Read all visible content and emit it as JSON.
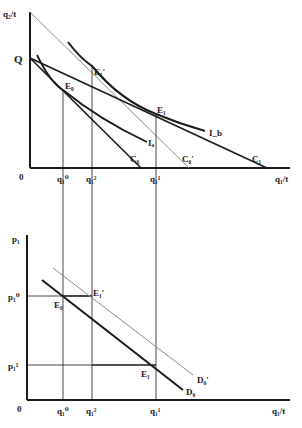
{
  "upper_panel": {
    "y_axis_label": "q₂/t",
    "x_axis_label": "q₁/t",
    "origin_label": "0",
    "endowment_label": "Q",
    "points": {
      "E0": "E₀",
      "E1": "E₁",
      "E1_prime": "E₁′"
    },
    "curves": {
      "Ia": "Iₐ",
      "Ib": "I_b",
      "C0": "C₀",
      "C0_prime": "C₀′",
      "C1": "C₁"
    },
    "x_ticks": [
      "q₁⁰",
      "q₁²",
      "q₁¹"
    ]
  },
  "lower_panel": {
    "y_axis_label": "p₁",
    "x_axis_label": "q₁/t",
    "origin_label": "0",
    "y_ticks": [
      "p₁⁰",
      "p₁¹"
    ],
    "points": {
      "E0": "E₀",
      "E1": "E₁",
      "E1_prime": "E₁′"
    },
    "curves": {
      "D0": "D₀",
      "D0_prime": "D₀′"
    },
    "x_ticks": [
      "q₁⁰",
      "q₁²",
      "q₁¹"
    ]
  },
  "colors": {
    "ink": "#1a1a1a",
    "gray_line": "#8c8c8c",
    "background": "#ffffff"
  }
}
